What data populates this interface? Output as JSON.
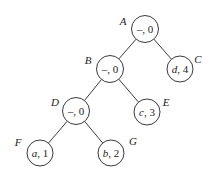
{
  "diagram": {
    "type": "binary-tree",
    "colors": {
      "background": "#ffffff",
      "stroke": "#3a3a3a",
      "text": "#222222"
    },
    "nodes": [
      {
        "id": "A",
        "label": "A",
        "symbol": "–",
        "sep": ", ",
        "weight": "0",
        "italic_symbol": false,
        "cx": 145,
        "cy": 29,
        "r": 13.5,
        "label_x": 123,
        "label_y": 21
      },
      {
        "id": "B",
        "label": "B",
        "symbol": "–",
        "sep": ", ",
        "weight": "0",
        "italic_symbol": false,
        "cx": 110,
        "cy": 69,
        "r": 13.5,
        "label_x": 88,
        "label_y": 60
      },
      {
        "id": "C",
        "label": "C",
        "symbol": "d",
        "sep": ", ",
        "weight": "4",
        "italic_symbol": true,
        "cx": 180,
        "cy": 69,
        "r": 13,
        "label_x": 198,
        "label_y": 59
      },
      {
        "id": "D",
        "label": "D",
        "symbol": "–",
        "sep": ", ",
        "weight": "0",
        "italic_symbol": false,
        "cx": 76,
        "cy": 111,
        "r": 13.5,
        "label_x": 55,
        "label_y": 102
      },
      {
        "id": "E",
        "label": "E",
        "symbol": "c",
        "sep": ", ",
        "weight": "3",
        "italic_symbol": true,
        "cx": 147,
        "cy": 112,
        "r": 13,
        "label_x": 166,
        "label_y": 102
      },
      {
        "id": "F",
        "label": "F",
        "symbol": "a",
        "sep": ", ",
        "weight": "1",
        "italic_symbol": true,
        "cx": 40,
        "cy": 153,
        "r": 13,
        "label_x": 18,
        "label_y": 142
      },
      {
        "id": "G",
        "label": "G",
        "symbol": "b",
        "sep": ", ",
        "weight": "2",
        "italic_symbol": true,
        "cx": 111,
        "cy": 153,
        "r": 13,
        "label_x": 133,
        "label_y": 141
      }
    ],
    "edges": [
      {
        "from": "A",
        "to": "B"
      },
      {
        "from": "A",
        "to": "C"
      },
      {
        "from": "B",
        "to": "D"
      },
      {
        "from": "B",
        "to": "E"
      },
      {
        "from": "D",
        "to": "F"
      },
      {
        "from": "D",
        "to": "G"
      }
    ]
  }
}
